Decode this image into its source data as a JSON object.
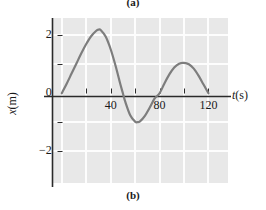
{
  "figure": {
    "panel_a_caption": "(a)",
    "panel_b_caption": "(b)"
  },
  "chart_data": {
    "type": "line",
    "title": "",
    "subtitle": "",
    "xlabel": "t (s)",
    "xlabel_symbol": "t",
    "xlabel_unit": "(s)",
    "ylabel": "x (m)",
    "ylabel_symbol": "x",
    "ylabel_unit": "(m)",
    "xlim": [
      -8,
      136
    ],
    "ylim": [
      -3.1,
      2.6
    ],
    "grid": true,
    "grid_color": "#fdfdfd",
    "plot_background": "#e8e8e8",
    "line_color": "#7d7d7d",
    "line_width": 2.2,
    "legend": null,
    "x_ticks": [
      0,
      20,
      40,
      60,
      80,
      100,
      120
    ],
    "x_tick_labels": [
      "",
      "",
      "40",
      "",
      "80",
      "",
      "120"
    ],
    "y_ticks": [
      -2,
      -1,
      0,
      1,
      2
    ],
    "y_tick_labels": [
      "-2",
      "",
      "0",
      "",
      "2"
    ],
    "x_gridlines": [
      0,
      20,
      40,
      60,
      80,
      100,
      120
    ],
    "y_gridlines": [
      -2,
      -1,
      1,
      2
    ],
    "series": [
      {
        "name": "x(t)",
        "x": [
          0,
          4,
          8,
          12,
          16,
          20,
          24,
          28,
          30,
          32,
          36,
          40,
          44,
          48,
          50,
          52,
          56,
          60,
          62,
          64,
          68,
          72,
          76,
          80,
          84,
          88,
          92,
          96,
          100,
          104,
          108,
          112,
          116,
          120
        ],
        "y": [
          0,
          0.33,
          0.68,
          1.03,
          1.38,
          1.7,
          1.97,
          2.15,
          2.2,
          2.18,
          1.95,
          1.52,
          0.95,
          0.3,
          0.0,
          -0.3,
          -0.76,
          -0.98,
          -1.0,
          -0.97,
          -0.78,
          -0.49,
          -0.18,
          0.0,
          0.34,
          0.65,
          0.89,
          1.02,
          1.05,
          1.0,
          0.85,
          0.6,
          0.3,
          0.0
        ]
      }
    ],
    "annotations": {
      "first_peak": {
        "t": 30,
        "x": 2.2
      },
      "first_zero_crossing": {
        "t": 50,
        "x": 0
      },
      "trough": {
        "t": 62,
        "x": -1.0
      },
      "second_zero_crossing": {
        "t": 80,
        "x": 0
      },
      "second_peak": {
        "t": 100,
        "x": 1.05
      },
      "final_zero": {
        "t": 120,
        "x": 0
      }
    }
  }
}
